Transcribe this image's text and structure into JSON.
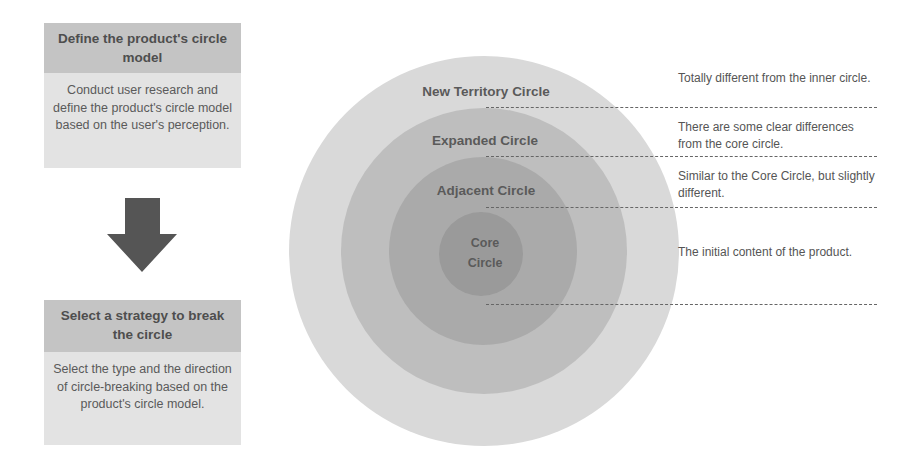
{
  "steps": [
    {
      "title": "Define the product's circle model",
      "body": "Conduct user research and define the product's circle model based on the user's perception."
    },
    {
      "title": "Select a strategy to break the circle",
      "body": "Select the type and the direction of circle-breaking based on the product's circle model."
    }
  ],
  "arrow": {
    "icon": "down-arrow-icon",
    "color": "#555555"
  },
  "circles": [
    {
      "name": "New Territory Circle",
      "color": "#d9d9d9",
      "radius": 195,
      "description": "Totally different from the inner circle."
    },
    {
      "name": "Expanded Circle",
      "color": "#bebebe",
      "radius": 143,
      "description": "There are some clear differences from the core circle."
    },
    {
      "name": "Adjacent Circle",
      "color": "#aaaaaa",
      "radius": 94,
      "description": "Similar to the Core Circle, but slightly different."
    },
    {
      "name": "Core Circle",
      "name_line1": "Core",
      "name_line2": "Circle",
      "color": "#9a9a9a",
      "radius": 42,
      "description": "The initial content of the product."
    }
  ]
}
